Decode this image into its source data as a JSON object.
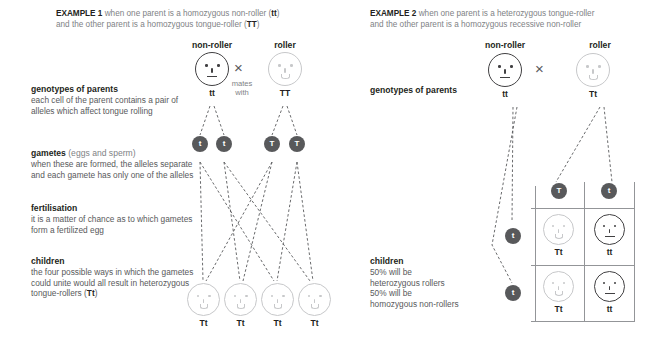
{
  "examples": [
    {
      "id": "example-1",
      "tag": "EXAMPLE 1",
      "intro_part1": " when one parent is a homozygous non-roller (",
      "intro_allele1": "tt",
      "intro_part2": ")",
      "intro_line2_part1": "and the other parent is a homozygous tongue-roller (",
      "intro_allele2": "TT",
      "intro_line2_part2": ")",
      "parents": {
        "left_label": "non-roller",
        "left_genotype": "tt",
        "left_phenotype": "non-roller",
        "right_label": "roller",
        "right_genotype": "TT",
        "right_phenotype": "roller",
        "cross_symbol": "×",
        "mates_line1": "mates",
        "mates_line2": "with"
      },
      "stages": [
        {
          "name": "genotypes-of-parents",
          "heading": "genotypes of parents",
          "heading_regular": "",
          "body": "each cell of the parent contains a pair of alleles which affect tongue rolling"
        },
        {
          "name": "gametes",
          "heading": "gametes",
          "heading_regular": " (eggs and sperm)",
          "body": "when these are formed, the alleles separate and each gamete has only one of the alleles"
        },
        {
          "name": "fertilisation",
          "heading": "fertilisation",
          "heading_regular": "",
          "body": "it is a matter of chance as to which gametes form a fertilized egg"
        },
        {
          "name": "children",
          "heading": "children",
          "heading_regular": "",
          "body_part1": "the four possible ways in which the gametes could unite would all result in heterozygous tongue-rollers (",
          "body_allele": "Tt",
          "body_part2": ")"
        }
      ],
      "gametes": [
        {
          "allele": "t",
          "phenotype": "non-roller"
        },
        {
          "allele": "t",
          "phenotype": "non-roller"
        },
        {
          "allele": "T",
          "phenotype": "roller"
        },
        {
          "allele": "T",
          "phenotype": "roller"
        }
      ],
      "children": [
        {
          "genotype": "Tt",
          "phenotype": "roller"
        },
        {
          "genotype": "Tt",
          "phenotype": "roller"
        },
        {
          "genotype": "Tt",
          "phenotype": "roller"
        },
        {
          "genotype": "Tt",
          "phenotype": "roller"
        }
      ]
    },
    {
      "id": "example-2",
      "tag": "EXAMPLE 2",
      "intro_part1": " when one parent is a heterozygous tongue-roller",
      "intro_line2": "and the other parent is a homozygous recessive non-roller",
      "parents": {
        "left_label": "non-roller",
        "left_genotype": "tt",
        "left_phenotype": "non-roller",
        "right_label": "roller",
        "right_genotype": "Tt",
        "right_phenotype": "roller",
        "cross_symbol": "×"
      },
      "stages": [
        {
          "name": "genotypes-of-parents",
          "heading": "genotypes of parents",
          "body": ""
        },
        {
          "name": "children",
          "heading": "children",
          "body_line1": "50% will be",
          "body_line2": "heterozygous rollers",
          "body_line3": "50% will be",
          "body_line4": "homozygous non-rollers"
        }
      ],
      "punnett": {
        "column_alleles": [
          "T",
          "t"
        ],
        "row_alleles": [
          "t",
          "t"
        ],
        "cells": [
          {
            "genotype": "Tt",
            "phenotype": "roller"
          },
          {
            "genotype": "tt",
            "phenotype": "non-roller"
          },
          {
            "genotype": "Tt",
            "phenotype": "roller"
          },
          {
            "genotype": "tt",
            "phenotype": "non-roller"
          }
        ]
      }
    }
  ],
  "colors": {
    "text_dark": "#231f20",
    "text_gray": "#808285",
    "face_dark": "#414042",
    "face_light": "#c7c8ca",
    "puck_fill": "#58595b",
    "grid_line": "#939598",
    "background": "#ffffff"
  }
}
